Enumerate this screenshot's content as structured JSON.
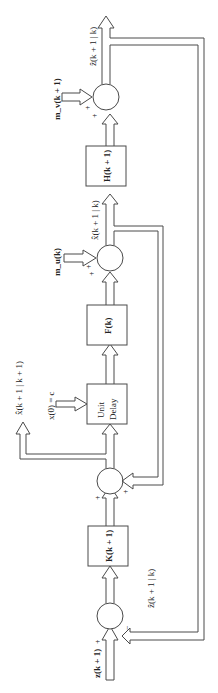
{
  "diagram": {
    "type": "block-diagram",
    "title": "",
    "orientation": "rotated-90-ccw",
    "blocks": [
      {
        "id": "K",
        "label": "K(k + 1)"
      },
      {
        "id": "delay",
        "label_line1": "Unit",
        "label_line2": "Delay"
      },
      {
        "id": "F",
        "label": "F(k)"
      },
      {
        "id": "H",
        "label": "H(k + 1)"
      }
    ],
    "summers": [
      {
        "id": "s1",
        "signs": [
          "+",
          "−"
        ]
      },
      {
        "id": "s2",
        "signs": [
          "+",
          "+"
        ]
      },
      {
        "id": "s3",
        "signs": [
          "+",
          "+"
        ]
      },
      {
        "id": "s4",
        "signs": [
          "+",
          "+"
        ]
      }
    ],
    "signals": {
      "input": "z(k + 1)",
      "z_pred_feedback": "ẑ(k + 1 | k)",
      "x_filtered_out": "x̂(k + 1 | k + 1)",
      "initial_condition": "x(0) = c",
      "mu": "m_u(k)",
      "x_pred": "x̂(k + 1 | k)",
      "mv": "m_v(k + 1)",
      "z_pred_out": "ẑ(k + 1 | k)"
    },
    "sign_plus": "+",
    "sign_minus": "−"
  }
}
